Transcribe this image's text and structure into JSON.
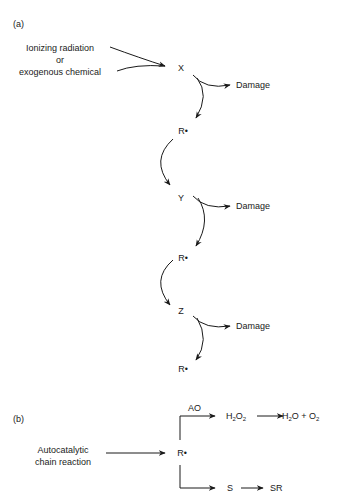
{
  "panel_a": {
    "label": "(a)",
    "input": {
      "line1": "Ionizing radiation",
      "line2": "or",
      "line3": "exogenous chemical"
    },
    "chain": [
      {
        "species": "X",
        "product": "Damage",
        "radical": "R•"
      },
      {
        "species": "Y",
        "product": "Damage",
        "radical": "R•"
      },
      {
        "species": "Z",
        "product": "Damage",
        "radical": "R•"
      }
    ]
  },
  "panel_b": {
    "label": "(b)",
    "input": {
      "line1": "Autocatalytic",
      "line2": "chain reaction"
    },
    "center": "R•",
    "upper_branch": {
      "enzyme": "AO",
      "h2o2": {
        "base1": "H",
        "sub1": "2",
        "base2": "O",
        "sub2": "2"
      },
      "products": {
        "h": "H",
        "h_sub": "2",
        "o_plus": "O + O",
        "o_sub": "2"
      }
    },
    "lower_branch": {
      "substrate": "S",
      "product": "SR"
    }
  },
  "colors": {
    "ink": "#1a1a1a",
    "background": "#ffffff"
  }
}
